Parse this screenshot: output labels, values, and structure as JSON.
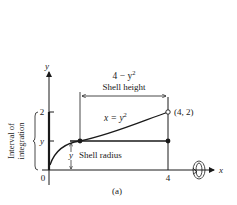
{
  "figure": {
    "label": "(a)",
    "axes": {
      "x_label": "x",
      "y_label": "y",
      "origin_label": "0",
      "x_tick": "4",
      "y_tick_top": "2",
      "y_tick_mid": "y"
    },
    "curve": {
      "equation_lhs": "x = y",
      "equation_exp": "2"
    },
    "point": {
      "label": "(4, 2)"
    },
    "shell_height": {
      "expr_base": "4 − y",
      "expr_exp": "2",
      "label": "Shell height"
    },
    "shell_radius": {
      "symbol": "y",
      "label": "Shell radius"
    },
    "interval": {
      "line1": "Interval of",
      "line2": "integration"
    },
    "rotation_axis_icon": "rotation-about-x-axis-icon"
  }
}
